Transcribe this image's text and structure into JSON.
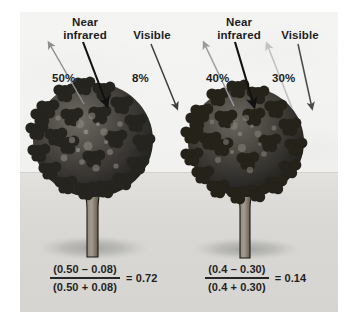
{
  "figure": {
    "background_color": "#f1f1ef",
    "ground_color": "#dcdbd7"
  },
  "scenes": [
    {
      "id": "healthy-tree",
      "bands": [
        {
          "name": "near-infrared",
          "label": "Near\ninfrared",
          "percent": "50%",
          "incoming_arrow_color": "#111111",
          "reflected_arrow_color": "#8f8f8f",
          "has_reflected_arrow": true
        },
        {
          "name": "visible",
          "label": "Visible",
          "percent": "8%",
          "incoming_arrow_color": "#3d3d3d",
          "reflected_arrow_color": "#cfcfcf",
          "has_reflected_arrow": false
        }
      ],
      "formula": {
        "numerator": "(0.50 – 0.08)",
        "denominator": "(0.50 + 0.08)",
        "result": "= 0.72"
      }
    },
    {
      "id": "stressed-tree",
      "bands": [
        {
          "name": "near-infrared",
          "label": "Near\ninfrared",
          "percent": "40%",
          "incoming_arrow_color": "#111111",
          "reflected_arrow_color": "#9a9a9a",
          "has_reflected_arrow": true
        },
        {
          "name": "visible",
          "label": "Visible",
          "percent": "30%",
          "incoming_arrow_color": "#4a4a4a",
          "reflected_arrow_color": "#c2c2c2",
          "has_reflected_arrow": true
        }
      ],
      "formula": {
        "numerator": "(0.4 – 0.30)",
        "denominator": "(0.4 + 0.30)",
        "result": "= 0.14"
      }
    }
  ]
}
